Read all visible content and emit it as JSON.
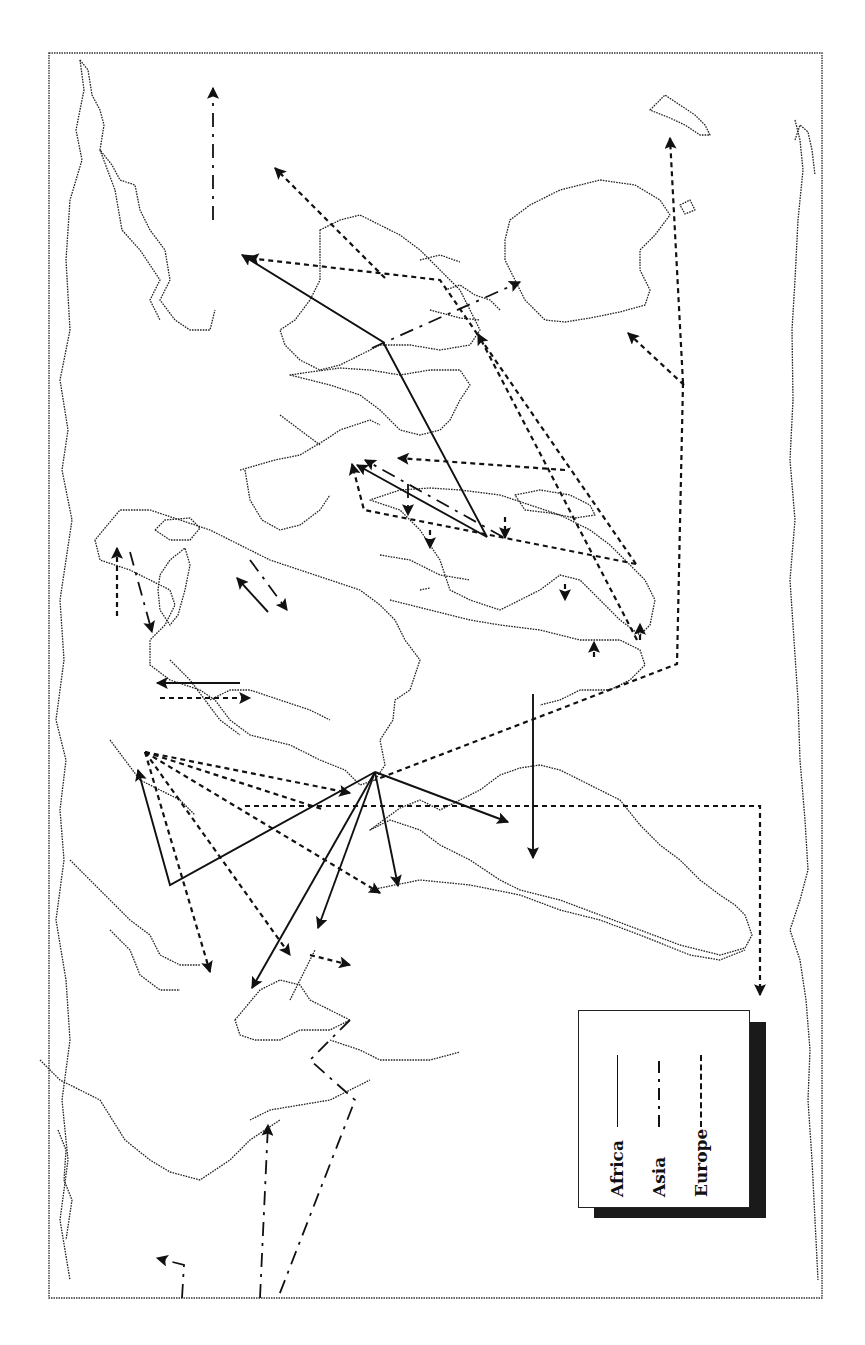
{
  "map": {
    "title": "",
    "orientation": "rotated 90° (north to the left)",
    "projection_frame": true
  },
  "legend": {
    "items": [
      {
        "label": "Africa",
        "line_style": "solid"
      },
      {
        "label": "Asia",
        "line_style": "dash-dot"
      },
      {
        "label": "Europe",
        "line_style": "dashed"
      }
    ]
  },
  "routes": {
    "africa": {
      "style": "solid",
      "count_visible_arrows": 10
    },
    "asia": {
      "style": "dash-dot",
      "count_visible_arrows": 9
    },
    "europe": {
      "style": "dashed",
      "count_visible_arrows": 22
    }
  },
  "colors": {
    "ink": "#111111",
    "background": "#ffffff",
    "legend_shadow": "#1a1a1a"
  }
}
